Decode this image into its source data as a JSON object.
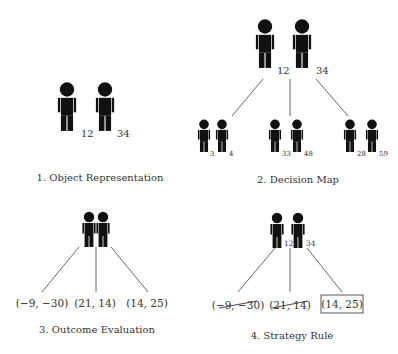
{
  "panels": [
    {
      "id": "object-representation",
      "caption": "1. Object Representation",
      "figures": [
        {
          "label": "12"
        },
        {
          "label": "34"
        }
      ]
    },
    {
      "id": "decision-map",
      "caption": "2. Decision Map",
      "figures": [
        {
          "label": "12"
        },
        {
          "label": "34"
        }
      ],
      "branches": [
        {
          "figures": [
            {
              "label": "3"
            },
            {
              "label": "4"
            }
          ]
        },
        {
          "figures": [
            {
              "label": "33"
            },
            {
              "label": "48"
            }
          ]
        },
        {
          "figures": [
            {
              "label": "28"
            },
            {
              "label": "59"
            }
          ]
        }
      ]
    },
    {
      "id": "outcome-evaluation",
      "caption": "3. Outcome Evaluation",
      "outcomes": [
        {
          "label": "(−9, −30)"
        },
        {
          "label": "(21, 14)"
        },
        {
          "label": "(14, 25)"
        }
      ]
    },
    {
      "id": "strategy-rule",
      "caption": "4. Strategy Rule",
      "figures": [
        {
          "label": "12"
        },
        {
          "label": "34"
        }
      ],
      "outcomes": [
        {
          "label": "(−9, −30)",
          "status": "struck"
        },
        {
          "label": "(21, 14)",
          "status": "struck"
        },
        {
          "label": "(14, 25)",
          "status": "selected"
        }
      ]
    }
  ]
}
